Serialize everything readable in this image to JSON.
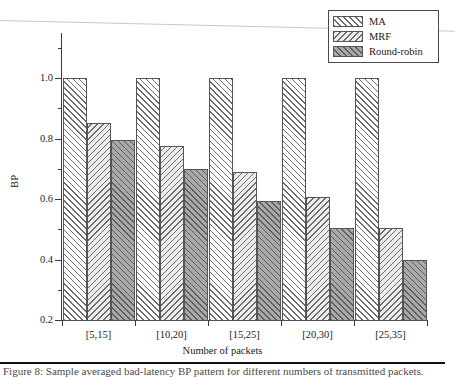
{
  "chart_data": {
    "type": "bar",
    "title": "",
    "xlabel": "Number of packets",
    "ylabel": "BP",
    "categories": [
      "[5,15]",
      "[10,20]",
      "[15,25]",
      "[20,30]",
      "[25,35]"
    ],
    "series": [
      {
        "name": "MA",
        "values": [
          1.0,
          1.0,
          1.0,
          1.0,
          1.0
        ]
      },
      {
        "name": "MRF",
        "values": [
          0.85,
          0.775,
          0.69,
          0.605,
          0.505
        ]
      },
      {
        "name": "Round-robin",
        "values": [
          0.795,
          0.7,
          0.595,
          0.505,
          0.4
        ]
      }
    ],
    "ylim": [
      0.2,
      1.0
    ],
    "ytick_labels": [
      "0.2",
      "0.4",
      "0.6",
      "0.8",
      "1.0"
    ],
    "ytick_values": [
      0.2,
      0.4,
      0.6,
      0.8,
      1.0
    ],
    "yminor_values": [
      0.3,
      0.5,
      0.7,
      0.9,
      1.1
    ],
    "grid": false,
    "legend_position": "top-right",
    "bar_group_style": "adjacent"
  },
  "legend": {
    "entries": [
      {
        "label": "MA",
        "swatch": "hatch-forward-white",
        "fill": "#ffffff",
        "hatch": "#6d6d6d"
      },
      {
        "label": "MRF",
        "swatch": "hatch-backward-light",
        "fill": "#ececec",
        "hatch": "#6d6d6d"
      },
      {
        "label": "Round-robin",
        "swatch": "hatch-forward-gray",
        "fill": "#a9a9a9",
        "hatch": "#5e5e5e"
      }
    ]
  },
  "axes": {
    "y_title": "BP",
    "x_title": "Number of packets"
  },
  "page": {
    "caption_clipped": "Figure 8: Sample averaged bad-latency BP pattern for different numbers of transmitted packets."
  }
}
